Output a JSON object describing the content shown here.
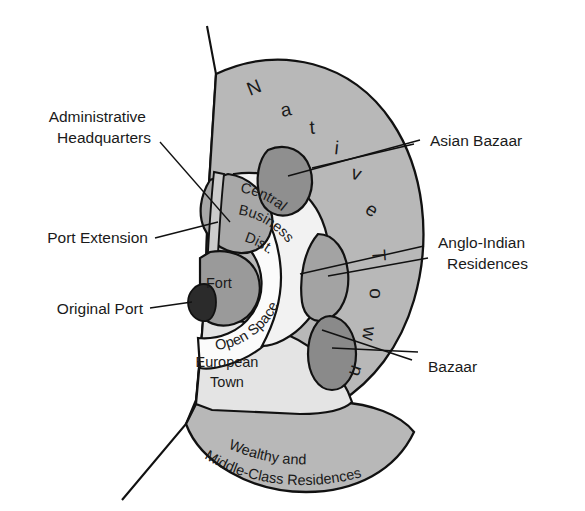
{
  "diagram": {
    "type": "annotated-map-diagram",
    "background": "#ffffff",
    "colors": {
      "native_town": "#b8b8b8",
      "outer_residences": "#b8b8b8",
      "european_town": "#e4e4e4",
      "open_space": "#fbfbfb",
      "cbd": "#f2f2f2",
      "fort": "#9a9a9a",
      "original_port": "#2b2b2b",
      "admin_hq": "#a8a8a8",
      "port_extension": "#cccccc",
      "asian_bazaar": "#8f8f8f",
      "anglo_indian": "#a3a3a3",
      "bazaar": "#8a8a8a",
      "stroke": "#111111",
      "text": "#1a1a1a"
    },
    "callout_labels": [
      {
        "id": "administrative-headquarters",
        "line1": "Administrative",
        "line2": "Headquarters",
        "side": "left"
      },
      {
        "id": "port-extension",
        "line1": "Port Extension",
        "line2": "",
        "side": "left"
      },
      {
        "id": "original-port",
        "line1": "Original Port",
        "line2": "",
        "side": "left"
      },
      {
        "id": "asian-bazaar",
        "line1": "Asian Bazaar",
        "line2": "",
        "side": "right"
      },
      {
        "id": "anglo-indian-residences",
        "line1": "Anglo-Indian",
        "line2": "Residences",
        "side": "right"
      },
      {
        "id": "bazaar",
        "line1": "Bazaar",
        "line2": "",
        "side": "right"
      }
    ],
    "inner_labels": [
      {
        "id": "central-business-district",
        "text": "Central Business Dist.",
        "lines": [
          "Central",
          "Business",
          "Dist."
        ],
        "style": "curved"
      },
      {
        "id": "open-space",
        "text": "Open Space",
        "lines": [
          "Open Space"
        ],
        "style": "curved"
      },
      {
        "id": "fort",
        "text": "Fort",
        "lines": [
          "Fort"
        ],
        "style": "straight"
      },
      {
        "id": "european-town",
        "text": "European Town",
        "lines": [
          "European",
          "Town"
        ],
        "style": "straight"
      },
      {
        "id": "wealthy-middle-class",
        "text": "Wealthy and Middle-Class Residences",
        "lines": [
          "Wealthy and",
          "Middle-Class Residences"
        ],
        "style": "curved"
      },
      {
        "id": "native-town",
        "text": "Native Town",
        "lines": [
          "Native",
          "Town"
        ],
        "style": "spaced-arc"
      }
    ],
    "native_town_letters_top": [
      "N",
      "a",
      "t",
      "i",
      "v",
      "e"
    ],
    "native_town_letters_right": [
      "T",
      "o",
      "w",
      "n"
    ]
  }
}
